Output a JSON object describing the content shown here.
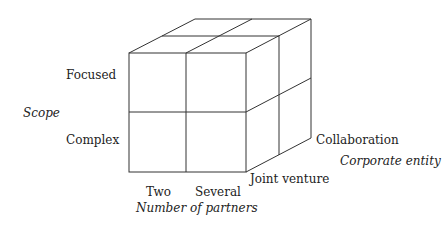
{
  "diagram": {
    "type": "3d-cube-matrix",
    "axes": {
      "vertical": {
        "title": "Scope",
        "levels": [
          "Focused",
          "Complex"
        ]
      },
      "horizontal": {
        "title": "Number of partners",
        "levels": [
          "Two",
          "Several"
        ]
      },
      "depth": {
        "title": "Corporate entity",
        "levels": [
          "Joint venture",
          "Collaboration"
        ]
      }
    },
    "line_color": "#333333"
  }
}
